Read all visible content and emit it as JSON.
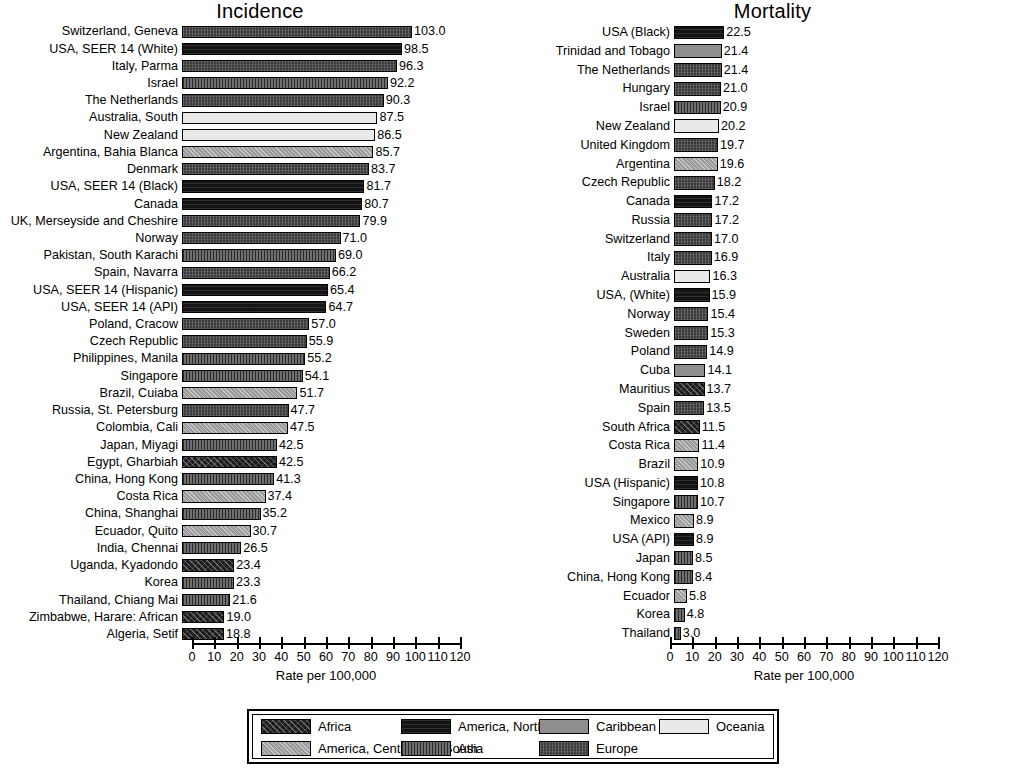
{
  "figure": {
    "axis_title": "Rate per 100,000",
    "xticks": [
      0,
      10,
      20,
      30,
      40,
      50,
      60,
      70,
      80,
      90,
      100,
      110,
      120
    ]
  },
  "panels": {
    "incidence": {
      "title": "Incidence"
    },
    "mortality": {
      "title": "Mortality"
    }
  },
  "legend": {
    "items": [
      {
        "label": "Africa",
        "key": "africa"
      },
      {
        "label": "America, Central and South",
        "key": "acs"
      },
      {
        "label": "America, North",
        "key": "anorth"
      },
      {
        "label": "Asia",
        "key": "asia"
      },
      {
        "label": "Caribbean",
        "key": "carib"
      },
      {
        "label": "Europe",
        "key": "europe"
      },
      {
        "label": "Oceania",
        "key": "oceania"
      }
    ]
  },
  "chart_data": [
    {
      "type": "bar",
      "title": "Incidence",
      "orientation": "horizontal",
      "xlabel": "Rate per 100,000",
      "ylabel": "",
      "xlim": [
        0,
        120
      ],
      "xticks": [
        0,
        10,
        20,
        30,
        40,
        50,
        60,
        70,
        80,
        90,
        100,
        110,
        120
      ],
      "grid": false,
      "legend_position": "bottom",
      "categories": [
        "Switzerland, Geneva",
        "USA, SEER 14 (White)",
        "Italy, Parma",
        "Israel",
        "The Netherlands",
        "Australia, South",
        "New Zealand",
        "Argentina, Bahia Blanca",
        "Denmark",
        "USA, SEER 14 (Black)",
        "Canada",
        "UK, Merseyside and Cheshire",
        "Norway",
        "Pakistan, South Karachi",
        "Spain, Navarra",
        "USA, SEER 14 (Hispanic)",
        "USA, SEER 14 (API)",
        "Poland, Cracow",
        "Czech Republic",
        "Philippines, Manila",
        "Singapore",
        "Brazil, Cuiaba",
        "Russia, St. Petersburg",
        "Colombia, Cali",
        "Japan, Miyagi",
        "Egypt, Gharbiah",
        "China, Hong Kong",
        "Costa Rica",
        "China, Shanghai",
        "Ecuador, Quito",
        "India, Chennai",
        "Uganda, Kyadondo",
        "Korea",
        "Thailand, Chiang Mai",
        "Zimbabwe, Harare: African",
        "Algeria, Setif"
      ],
      "values": [
        103.0,
        98.5,
        96.3,
        92.2,
        90.3,
        87.5,
        86.5,
        85.7,
        83.7,
        81.7,
        80.7,
        79.9,
        71.0,
        69.0,
        66.2,
        65.4,
        64.7,
        57.0,
        55.9,
        55.2,
        54.1,
        51.7,
        47.7,
        47.5,
        42.5,
        42.5,
        41.3,
        37.4,
        35.2,
        30.7,
        26.5,
        23.4,
        23.3,
        21.6,
        19.0,
        18.8
      ],
      "regions": [
        "europe",
        "anorth",
        "europe",
        "asia",
        "europe",
        "oceania",
        "oceania",
        "acs",
        "europe",
        "anorth",
        "anorth",
        "europe",
        "europe",
        "asia",
        "europe",
        "anorth",
        "anorth",
        "europe",
        "europe",
        "asia",
        "asia",
        "acs",
        "europe",
        "acs",
        "asia",
        "africa",
        "asia",
        "acs",
        "asia",
        "acs",
        "asia",
        "africa",
        "asia",
        "asia",
        "africa",
        "africa"
      ]
    },
    {
      "type": "bar",
      "title": "Mortality",
      "orientation": "horizontal",
      "xlabel": "Rate per 100,000",
      "ylabel": "",
      "xlim": [
        0,
        120
      ],
      "xticks": [
        0,
        10,
        20,
        30,
        40,
        50,
        60,
        70,
        80,
        90,
        100,
        110,
        120
      ],
      "grid": false,
      "legend_position": "bottom",
      "categories": [
        "USA (Black)",
        "Trinidad and Tobago",
        "The Netherlands",
        "Hungary",
        "Israel",
        "New Zealand",
        "United Kingdom",
        "Argentina",
        "Czech Republic",
        "Canada",
        "Russia",
        "Switzerland",
        "Italy",
        "Australia",
        "USA, (White)",
        "Norway",
        "Sweden",
        "Poland",
        "Cuba",
        "Mauritius",
        "Spain",
        "South Africa",
        "Costa Rica",
        "Brazil",
        "USA (Hispanic)",
        "Singapore",
        "Mexico",
        "USA (API)",
        "Japan",
        "China, Hong Kong",
        "Ecuador",
        "Korea",
        "Thailand"
      ],
      "values": [
        22.5,
        21.4,
        21.4,
        21.0,
        20.9,
        20.2,
        19.7,
        19.6,
        18.2,
        17.2,
        17.2,
        17.0,
        16.9,
        16.3,
        15.9,
        15.4,
        15.3,
        14.9,
        14.1,
        13.7,
        13.5,
        11.5,
        11.4,
        10.9,
        10.8,
        10.7,
        8.9,
        8.9,
        8.5,
        8.4,
        5.8,
        4.8,
        3.0
      ],
      "regions": [
        "anorth",
        "carib",
        "europe",
        "europe",
        "asia",
        "oceania",
        "europe",
        "acs",
        "europe",
        "anorth",
        "europe",
        "europe",
        "europe",
        "oceania",
        "anorth",
        "europe",
        "europe",
        "europe",
        "carib",
        "africa",
        "europe",
        "africa",
        "acs",
        "acs",
        "anorth",
        "asia",
        "acs",
        "anorth",
        "asia",
        "asia",
        "acs",
        "asia",
        "asia"
      ]
    }
  ]
}
